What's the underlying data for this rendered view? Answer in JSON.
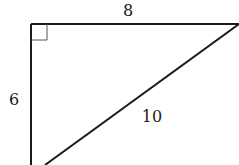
{
  "diagram": {
    "type": "right-triangle",
    "labels": {
      "top_side": "8",
      "left_side": "6",
      "hypotenuse": "10"
    },
    "right_angle_marker": true,
    "colors": {
      "stroke": "#1a1a1a",
      "background": "#ffffff"
    }
  }
}
